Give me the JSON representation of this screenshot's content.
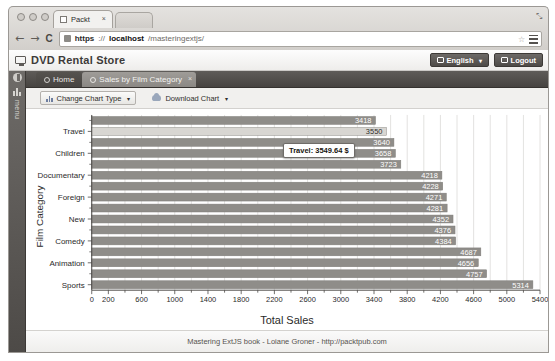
{
  "browser": {
    "tab_title": "Packt",
    "tab_close": "×",
    "back_icon": "←",
    "forward_icon": "→",
    "reload_icon": "C",
    "url_scheme": "https",
    "url_sep": "://",
    "url_host": "localhost",
    "url_path": "/masteringextjs/",
    "star_icon": "☆",
    "expand_icon": "⤡"
  },
  "app": {
    "title": "DVD Rental Store",
    "language_button": "English",
    "logout_button": "Logout",
    "caret": "▾"
  },
  "sidebar": {
    "label": "menu"
  },
  "tabs": [
    {
      "label": "Home",
      "active": false,
      "closable": false
    },
    {
      "label": "Sales by Film Category",
      "active": true,
      "closable": true,
      "close_icon": "×"
    }
  ],
  "toolbar": {
    "change_chart_type": "Change Chart Type",
    "download_chart": "Download Chart",
    "caret": "▾"
  },
  "tooltip": {
    "text": "Travel: 3549.64 $"
  },
  "footer": {
    "text": "Mastering ExtJS book - Loiane Groner - http://packtpub.com"
  },
  "chart_data": {
    "type": "bar",
    "orientation": "horizontal",
    "title": "",
    "xlabel": "Total Sales",
    "ylabel": "Film Category",
    "xlim": [
      0,
      5400
    ],
    "xticks": [
      0,
      200,
      400,
      600,
      800,
      1000,
      1200,
      1400,
      1600,
      1800,
      2000,
      2200,
      2400,
      2600,
      2800,
      3000,
      3200,
      3400,
      3600,
      3800,
      4000,
      4200,
      4400,
      4600,
      4800,
      5000,
      5200,
      5400
    ],
    "xtick_labels": [
      "0",
      "",
      "200",
      "",
      "600",
      "",
      "1000",
      "",
      "1400",
      "",
      "1800",
      "",
      "2200",
      "",
      "2600",
      "",
      "3000",
      "",
      "3400",
      "",
      "3800",
      "",
      "4200",
      "",
      "4600",
      "",
      "5000",
      "5400"
    ],
    "xtick_labeled": [
      0,
      200,
      600,
      1000,
      1400,
      1800,
      2200,
      2600,
      3000,
      3400,
      3800,
      4200,
      4600,
      5000,
      5400
    ],
    "grid": true,
    "bar_color": "#8f8d89",
    "bar_highlight_color": "#d8d6d2",
    "categories": [
      "Music",
      "Travel",
      "Horror",
      "Children",
      "Classics",
      "Documentary",
      "Games",
      "Foreign",
      "Family",
      "New",
      "Drama",
      "Comedy",
      "Action",
      "Animation",
      "Sci-Fi",
      "Sports"
    ],
    "visible_category_labels": [
      "Travel",
      "Children",
      "Documentary",
      "Foreign",
      "New",
      "Comedy",
      "Animation",
      "Sports"
    ],
    "values": [
      3418,
      3550,
      3640,
      3658,
      3723,
      4218,
      4228,
      4271,
      4281,
      4352,
      4376,
      4384,
      4687,
      4656,
      4757,
      5314
    ],
    "value_labels": [
      "3418",
      "3550",
      "3640",
      "3658",
      "3723",
      "4218",
      "4228",
      "4271",
      "4281",
      "4352",
      "4376",
      "4384",
      "4687",
      "4656",
      "4757",
      "5314"
    ],
    "highlighted_index": 1,
    "highlighted_value_exact": "3549.64"
  }
}
